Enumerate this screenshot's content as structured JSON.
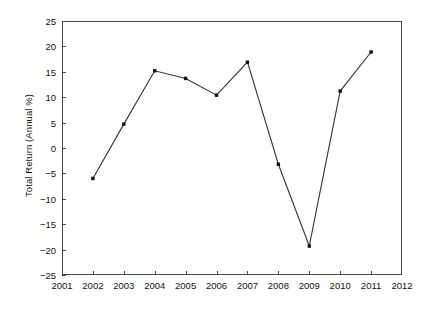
{
  "chart_data": {
    "type": "line",
    "title": "",
    "subtitle": "",
    "xlabel": "",
    "ylabel": "Total Return (Annual %)",
    "x": [
      2002,
      2003,
      2004,
      2005,
      2006,
      2007,
      2008,
      2009,
      2010,
      2011
    ],
    "values": [
      -6.0,
      4.7,
      15.2,
      13.7,
      10.4,
      16.9,
      -3.2,
      -19.3,
      11.2,
      18.9
    ],
    "series": [
      {
        "name": "Total Return",
        "values": [
          -6.0,
          4.7,
          15.2,
          13.7,
          10.4,
          16.9,
          -3.2,
          -19.3,
          11.2,
          18.9
        ]
      }
    ],
    "xlim": [
      2001,
      2012
    ],
    "ylim": [
      -25,
      25
    ],
    "xticks": [
      2001,
      2002,
      2003,
      2004,
      2005,
      2006,
      2007,
      2008,
      2009,
      2010,
      2011,
      2012
    ],
    "xtick_labels": [
      "2001",
      "2002",
      "2003",
      "2004",
      "2005",
      "2006",
      "2007",
      "2008",
      "2009",
      "2010",
      "2011",
      "2012"
    ],
    "yticks": [
      -25,
      -20,
      -15,
      -10,
      -5,
      0,
      5,
      10,
      15,
      20,
      25
    ],
    "ytick_labels": [
      "−25",
      "−20",
      "−15",
      "−10",
      "−5",
      "0",
      "5",
      "10",
      "15",
      "20",
      "25"
    ],
    "grid": false,
    "legend": false,
    "legend_position": "none",
    "marker": "square",
    "line_color": "#333333",
    "marker_color": "#111111",
    "frame_color": "#4a4a4a",
    "background_color": "#ffffff",
    "annotations": []
  }
}
